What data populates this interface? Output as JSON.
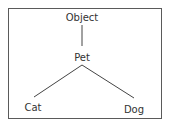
{
  "diagram": {
    "type": "tree",
    "border_color": "#5a5a5a",
    "line_color": "#444444",
    "text_color": "#333333",
    "nodes": [
      {
        "id": "object",
        "label": "Object",
        "x": 82,
        "y": 13
      },
      {
        "id": "pet",
        "label": "Pet",
        "x": 82,
        "y": 53
      },
      {
        "id": "cat",
        "label": "Cat",
        "x": 33,
        "y": 103
      },
      {
        "id": "dog",
        "label": "Dog",
        "x": 134,
        "y": 105
      }
    ],
    "edges": [
      {
        "from": "object",
        "to": "pet"
      },
      {
        "from": "pet",
        "to": "cat"
      },
      {
        "from": "pet",
        "to": "dog"
      }
    ]
  }
}
